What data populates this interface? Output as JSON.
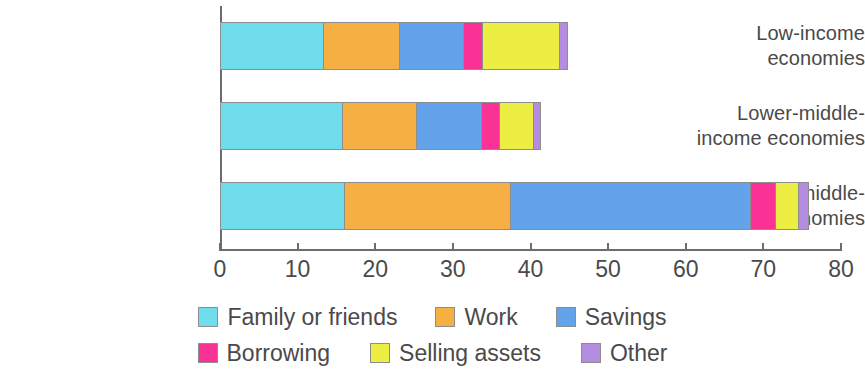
{
  "chart_data": {
    "type": "bar",
    "orientation": "horizontal",
    "stacked": true,
    "title": "",
    "subtitle": "",
    "xlabel": "",
    "ylabel": "",
    "xlim": [
      0,
      80
    ],
    "grid": false,
    "legend_position": "bottom",
    "categories": [
      "Low-income economies",
      "Lower-middle-income economies",
      "Upper-middle-income economies"
    ],
    "category_lines": [
      [
        "Low-income",
        "economies"
      ],
      [
        "Lower-middle-",
        "income economies"
      ],
      [
        "Upper-middle-",
        "income economies"
      ]
    ],
    "xticks": [
      0,
      10,
      20,
      30,
      40,
      50,
      60,
      70,
      80
    ],
    "xticklabels": [
      "0",
      "10",
      "20",
      "30",
      "40",
      "50",
      "60",
      "70",
      "80"
    ],
    "series": [
      {
        "name": "Family or friends",
        "color": "#6FDDEC",
        "values": [
          13.3,
          15.8,
          16.0
        ]
      },
      {
        "name": "Work",
        "color": "#F5AF43",
        "values": [
          9.9,
          9.6,
          21.5
        ]
      },
      {
        "name": "Savings",
        "color": "#62A3EC",
        "values": [
          8.3,
          8.4,
          31.0
        ]
      },
      {
        "name": "Borrowing",
        "color": "#FA3296",
        "values": [
          2.4,
          2.4,
          3.3
        ]
      },
      {
        "name": "Selling assets",
        "color": "#EDEE44",
        "values": [
          10.0,
          4.4,
          2.9
        ]
      },
      {
        "name": "Other",
        "color": "#B48CE0",
        "values": [
          0.9,
          0.7,
          1.2
        ]
      }
    ],
    "totals": [
      44.8,
      41.3,
      75.9
    ]
  },
  "legend": {
    "rows": [
      [
        {
          "label": "Family or friends",
          "color": "#6FDDEC"
        },
        {
          "label": "Work",
          "color": "#F5AF43"
        },
        {
          "label": "Savings",
          "color": "#62A3EC"
        }
      ],
      [
        {
          "label": "Borrowing",
          "color": "#FA3296"
        },
        {
          "label": "Selling assets",
          "color": "#EDEE44"
        },
        {
          "label": "Other",
          "color": "#B48CE0"
        }
      ]
    ]
  }
}
